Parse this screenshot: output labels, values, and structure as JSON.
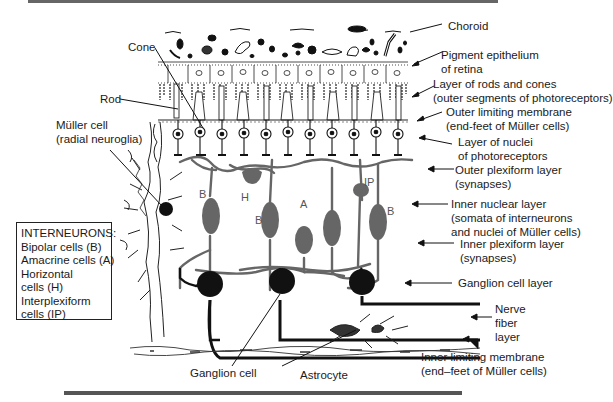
{
  "figure": {
    "structures": {
      "cone": "Cone",
      "rod": "Rod",
      "muller_cell_1": "Müller cell",
      "muller_cell_2": "(radial neuroglia)",
      "ganglion_cell": "Ganglion cell",
      "astrocyte": "Astrocyte"
    },
    "layers": {
      "choroid": "Choroid",
      "pigment_1": "Pigment epithelium",
      "pigment_2": "of retina",
      "rods_cones_1": "Layer of rods and cones",
      "rods_cones_2": "(outer segments of photoreceptors)",
      "olm_1": "Outer limiting membrane",
      "olm_2": "(end-feet of Müller cells)",
      "nuclei_1": "Layer of nuclei",
      "nuclei_2": "of photoreceptors",
      "opl_1": "Outer plexiform layer",
      "opl_2": "(synapses)",
      "inl_1": "Inner nuclear layer",
      "inl_2": "(somata of interneurons",
      "inl_3": "and nuclei of Müller cells)",
      "ipl_1": "Inner plexiform layer",
      "ipl_2": "(synapses)",
      "gcl": "Ganglion cell layer",
      "nfl_1": "Nerve",
      "nfl_2": "fiber",
      "nfl_3": "layer",
      "ilm_1": "Inner limiting membrane",
      "ilm_2": "(end–feet of Müller cells)"
    },
    "cell_letters": {
      "b1": "B",
      "h": "H",
      "b2": "B",
      "a": "A",
      "ip": "IP",
      "b3": "B"
    },
    "legend": {
      "title": "INTERNEURONS:",
      "items": [
        "Bipolar cells (B)",
        "Amacrine cells (A)",
        "Horizontal",
        "cells (H)",
        "Interplexiform",
        "cells (IP)"
      ]
    }
  }
}
